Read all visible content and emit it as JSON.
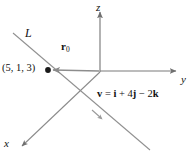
{
  "figure": {
    "kind": "3d-vector-line-diagram",
    "width": 195,
    "height": 162,
    "background": "#ffffff",
    "axes": {
      "z": {
        "label": "z",
        "icon": "arrow-up-icon"
      },
      "y": {
        "label": "y",
        "icon": "arrow-right-icon"
      },
      "x": {
        "label": "x",
        "icon": "arrow-down-left-icon"
      }
    },
    "line": {
      "label": "L"
    },
    "point": {
      "label": "(5, 1, 3)",
      "marker": "filled-dot"
    },
    "position_vector": {
      "symbol": "r",
      "subscript": "0"
    },
    "direction_vector": {
      "text_plain": "v = i + 4j − 2k",
      "lhs": "v",
      "equals": " = ",
      "i_coeff": "",
      "i_unit": "i",
      "plus": " + ",
      "j_coeff": "4",
      "j_unit": "j",
      "minus": " − ",
      "k_coeff": "2",
      "k_unit": "k"
    },
    "colors": {
      "axis": "#7a7a7a",
      "line": "#8d8d8d",
      "vector": "#8d8d8d",
      "text": "#111111",
      "dot": "#1a1a1a"
    }
  }
}
